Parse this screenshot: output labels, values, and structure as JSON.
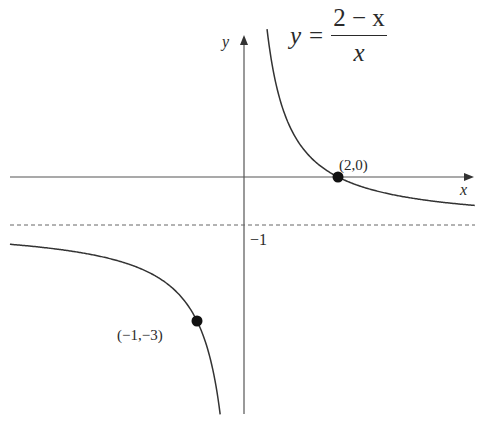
{
  "figure": {
    "equation": {
      "lhs": "y",
      "equals": "=",
      "numerator": "2 − x",
      "denominator": "x"
    },
    "axes": {
      "x_label": "x",
      "y_label": "y"
    },
    "asymptote_label": "−1",
    "points": [
      {
        "label": "(2,0)",
        "x": 2,
        "y": 0
      },
      {
        "label": "(−1,−3)",
        "x": -1,
        "y": -3
      }
    ],
    "colors": {
      "curve": "#333333",
      "axis": "#555555",
      "asymptote": "#666666",
      "point": "#111111"
    }
  },
  "chart_data": {
    "type": "line",
    "xlabel": "x",
    "ylabel": "y",
    "function": "y = (2 - x) / x",
    "asymptotes": {
      "vertical": "x = 0",
      "horizontal": "y = -1"
    },
    "branches": [
      {
        "name": "right branch",
        "x": [
          0.5,
          0.75,
          1,
          1.5,
          2,
          3,
          4,
          4.9
        ],
        "y": [
          3,
          1.667,
          1,
          0.333,
          0,
          -0.333,
          -0.5,
          -0.592
        ]
      },
      {
        "name": "left branch",
        "x": [
          -5,
          -4,
          -3,
          -2,
          -1,
          -0.75,
          -0.6,
          -0.5
        ],
        "y": [
          -1.4,
          -1.5,
          -1.667,
          -2,
          -3,
          -3.667,
          -4.333,
          -5
        ]
      }
    ],
    "marked_points": [
      {
        "label": "(2,0)",
        "x": 2,
        "y": 0
      },
      {
        "label": "(−1,−3)",
        "x": -1,
        "y": -3
      }
    ],
    "annotations": [
      "−1"
    ],
    "grid": false,
    "legend": null
  }
}
